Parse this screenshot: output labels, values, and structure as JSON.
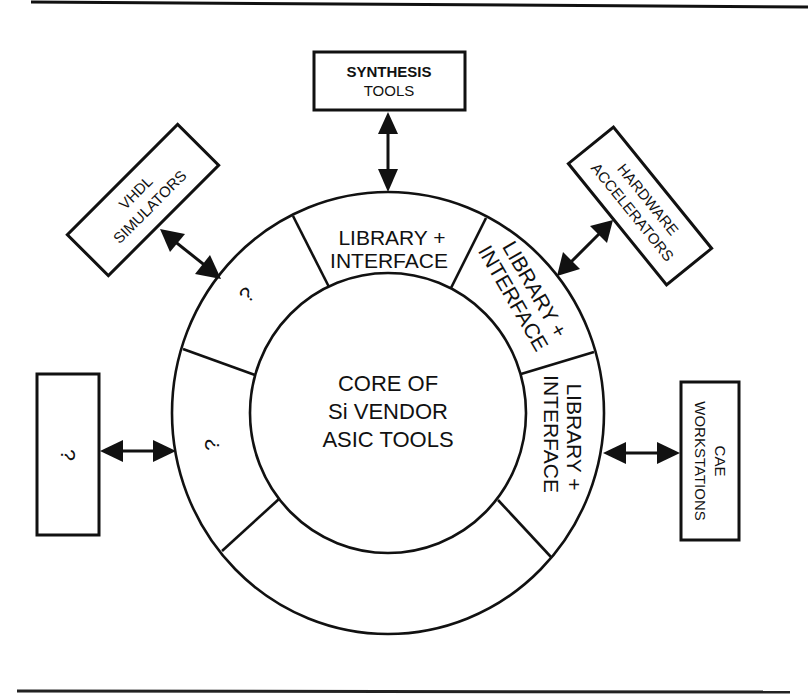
{
  "diagram": {
    "colors": {
      "ink": "#111111",
      "background": "#ffffff"
    },
    "core": {
      "lines": [
        "CORE OF",
        "Si VENDOR",
        "ASIC TOOLS"
      ]
    },
    "ring_segments": [
      {
        "position": "top",
        "lines": [
          "LIBRARY +",
          "INTERFACE"
        ]
      },
      {
        "position": "upper-right",
        "lines": [
          "LIBRARY +",
          "INTERFACE"
        ]
      },
      {
        "position": "right",
        "lines": [
          "LIBRARY +",
          "INTERFACE"
        ]
      },
      {
        "position": "bottom",
        "lines": []
      },
      {
        "position": "left",
        "lines": [
          "?"
        ]
      },
      {
        "position": "upper-left",
        "lines": [
          "?"
        ]
      }
    ],
    "external_boxes": [
      {
        "id": "synthesis",
        "lines": [
          "SYNTHESIS",
          "TOOLS"
        ]
      },
      {
        "id": "hardware",
        "lines": [
          "HARDWARE",
          "ACCELERATORS"
        ]
      },
      {
        "id": "cae",
        "lines": [
          "CAE",
          "WORKSTATIONS"
        ]
      },
      {
        "id": "vhdl",
        "lines": [
          "VHDL",
          "SIMULATORS"
        ]
      },
      {
        "id": "unknown",
        "lines": [
          "?"
        ]
      }
    ],
    "connections": [
      {
        "from": "synthesis",
        "to": "ring-top",
        "type": "bidirectional"
      },
      {
        "from": "hardware",
        "to": "ring-upper-right",
        "type": "bidirectional"
      },
      {
        "from": "cae",
        "to": "ring-right",
        "type": "bidirectional"
      },
      {
        "from": "vhdl",
        "to": "ring-upper-left",
        "type": "bidirectional"
      },
      {
        "from": "unknown",
        "to": "ring-left",
        "type": "bidirectional"
      }
    ]
  }
}
